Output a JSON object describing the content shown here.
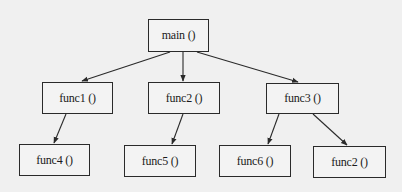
{
  "diagram": {
    "type": "call-tree",
    "nodes": [
      {
        "id": "main",
        "label": "main ()"
      },
      {
        "id": "func1",
        "label": "func1 ()"
      },
      {
        "id": "func2",
        "label": "func2 ()"
      },
      {
        "id": "func3",
        "label": "func3 ()"
      },
      {
        "id": "func4",
        "label": "func4 ()"
      },
      {
        "id": "func5",
        "label": "func5 ()"
      },
      {
        "id": "func6",
        "label": "func6 ()"
      },
      {
        "id": "func2b",
        "label": "func2 ()"
      }
    ],
    "edges": [
      {
        "from": "main",
        "to": "func1"
      },
      {
        "from": "main",
        "to": "func2"
      },
      {
        "from": "main",
        "to": "func3"
      },
      {
        "from": "func1",
        "to": "func4"
      },
      {
        "from": "func2",
        "to": "func5"
      },
      {
        "from": "func3",
        "to": "func6"
      },
      {
        "from": "func3",
        "to": "func2b"
      }
    ],
    "colors": {
      "line": "#2a2a2a",
      "background": "#f0f0f0"
    }
  }
}
